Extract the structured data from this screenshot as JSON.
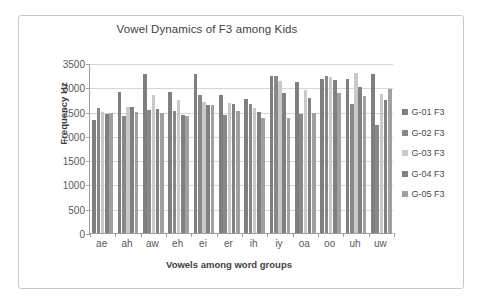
{
  "chart_data": {
    "type": "bar",
    "title": "Vowel Dynamics of F3 among Kids",
    "xlabel": "Vowels among word groups",
    "ylabel": "Frequency Hz",
    "categories": [
      "ae",
      "ah",
      "aw",
      "eh",
      "ei",
      "er",
      "ih",
      "iy",
      "oa",
      "oo",
      "uh",
      "uw"
    ],
    "ylim": [
      0,
      3500
    ],
    "yticks": [
      0,
      500,
      1000,
      1500,
      2000,
      2500,
      3000,
      3500
    ],
    "ytick_labels": [
      "0",
      "500",
      "1000",
      "1500",
      "2000",
      "2500",
      "3000",
      "3500"
    ],
    "grid": true,
    "legend_position": "right",
    "series": [
      {
        "name": "G-01 F3",
        "color": "#7f7f7f",
        "values": [
          2320,
          2900,
          3280,
          2900,
          3280,
          2840,
          2750,
          3230,
          3100,
          3170,
          3170,
          3270
        ]
      },
      {
        "name": "G-02 F3",
        "color": "#888888",
        "values": [
          2580,
          2400,
          2540,
          2510,
          2850,
          2440,
          2660,
          3240,
          2460,
          3240,
          2660,
          2220
        ]
      },
      {
        "name": "G-03 F3",
        "color": "#c9c9c9",
        "values": [
          2490,
          2600,
          2850,
          2740,
          2700,
          2680,
          2570,
          3130,
          2940,
          3210,
          3290,
          2860
        ]
      },
      {
        "name": "G-04 F3",
        "color": "#808080",
        "values": [
          2460,
          2590,
          2560,
          2440,
          2640,
          2660,
          2500,
          2880,
          2780,
          3150,
          3010,
          2730
        ]
      },
      {
        "name": "G-05 F3",
        "color": "#a0a0a0",
        "values": [
          2470,
          2500,
          2480,
          2410,
          2630,
          2520,
          2370,
          2370,
          2480,
          2880,
          2830,
          2970
        ]
      }
    ]
  },
  "legend": {
    "items": [
      {
        "label": "G-01 F3"
      },
      {
        "label": "G-02 F3"
      },
      {
        "label": "G-03 F3"
      },
      {
        "label": "G-04 F3"
      },
      {
        "label": "G-05 F3"
      }
    ]
  }
}
